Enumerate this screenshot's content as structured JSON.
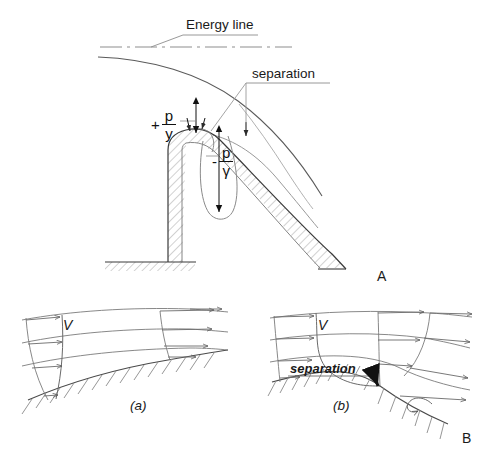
{
  "figure": {
    "title_panels": [
      "A",
      "B"
    ],
    "panel_a": {
      "id_label": "A",
      "labels": {
        "energy_line": "Energy line",
        "separation": "separation"
      },
      "pressure_positive": {
        "sign": "+",
        "numerator": "p",
        "denominator": "y"
      },
      "pressure_negative": {
        "sign": "-",
        "numerator": "p",
        "denominator": "γ"
      }
    },
    "panel_b": {
      "id_label": "B",
      "sub_a": {
        "caption": "(a)",
        "velocity_label": "V"
      },
      "sub_b": {
        "caption": "(b)",
        "velocity_label": "V",
        "separation_label": "separation"
      }
    }
  },
  "style": {
    "line_color": "#4a4a4a",
    "dark_line_color": "#2b2b2b",
    "hatch_color": "#8a8a8a",
    "text_color": "#1a1a1a",
    "background": "#ffffff"
  }
}
